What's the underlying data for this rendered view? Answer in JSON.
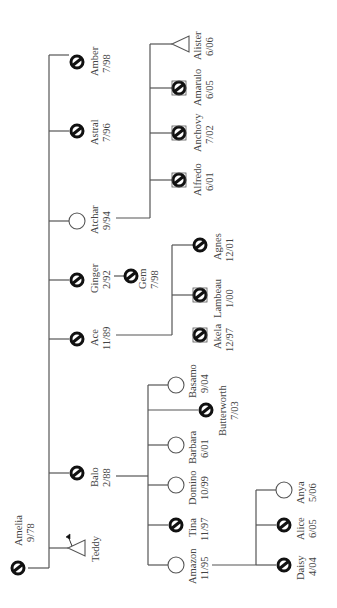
{
  "diagram": {
    "type": "pedigree",
    "orientation": "rotated-90-ccw",
    "colors": {
      "line": "#555555",
      "deceased_symbol": "#111111",
      "text": "#444444",
      "background": "#ffffff"
    },
    "legend_symbols": {
      "circle-slash": "deceased female / circle with slash",
      "circle": "living female (open circle)",
      "triangle": "pregnancy / unknown sex (triangle)"
    },
    "root": {
      "name": "Amelia",
      "date": "9/78",
      "symbol": "circle-slash"
    },
    "children": [
      {
        "id": "teddy",
        "name": "Teddy",
        "date": "",
        "symbol": "triangle-arrow"
      },
      {
        "id": "balo",
        "name": "Balo",
        "date": "2/88",
        "symbol": "circle-slash"
      },
      {
        "id": "ace",
        "name": "Ace",
        "date": "11/89",
        "symbol": "circle-slash"
      },
      {
        "id": "ginger",
        "name": "Ginger",
        "date": "2/92",
        "symbol": "circle-slash"
      },
      {
        "id": "atchar",
        "name": "Atchar",
        "date": "9/94",
        "symbol": "circle"
      },
      {
        "id": "astral",
        "name": "Astral",
        "date": "7/96",
        "symbol": "circle-slash"
      },
      {
        "id": "amber",
        "name": "Amber",
        "date": "7/98",
        "symbol": "circle-slash"
      }
    ],
    "ginger_children": [
      {
        "name": "Gem",
        "date": "7/98",
        "symbol": "circle-slash"
      }
    ],
    "atchar_children": [
      {
        "name": "Alfredo",
        "date": "6/01",
        "symbol": "circle-slash-hatched"
      },
      {
        "name": "Anchovy",
        "date": "7/02",
        "symbol": "circle-slash-hatched"
      },
      {
        "name": "Amarulo",
        "date": "6/05",
        "symbol": "circle-slash-hatched"
      },
      {
        "name": "Alister",
        "date": "6/06",
        "symbol": "triangle"
      }
    ],
    "ace_children": [
      {
        "name": "Akela",
        "date": "12/97",
        "symbol": "circle-slash-hatched"
      },
      {
        "name": "Lambeau",
        "date": "1/00",
        "symbol": "circle-slash-hatched"
      },
      {
        "name": "Agnes",
        "date": "12/01",
        "symbol": "circle-slash"
      }
    ],
    "balo_children": [
      {
        "name": "Amazon",
        "date": "11/95",
        "symbol": "circle"
      },
      {
        "name": "Tina",
        "date": "11/97",
        "symbol": "circle-slash"
      },
      {
        "name": "Domino",
        "date": "10/99",
        "symbol": "circle"
      },
      {
        "name": "Barbara",
        "date": "6/01",
        "symbol": "circle"
      },
      {
        "name": "Butterworth",
        "date": "7/03",
        "symbol": "circle-slash"
      },
      {
        "name": "Basamo",
        "date": "9/04",
        "symbol": "circle"
      }
    ],
    "amazon_children": [
      {
        "name": "Daisy",
        "date": "4/04",
        "symbol": "circle-slash"
      },
      {
        "name": "Alice",
        "date": "6/05",
        "symbol": "circle-slash"
      },
      {
        "name": "Anya",
        "date": "5/06",
        "symbol": "circle"
      }
    ]
  }
}
